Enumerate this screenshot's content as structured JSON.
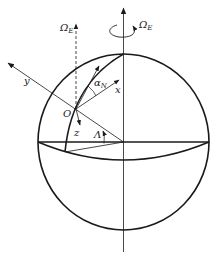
{
  "diagram": {
    "title": "",
    "labels": {
      "omega_e_axis": "Ω",
      "omega_e_axis_sub": "E",
      "omega_e_local": "Ω",
      "omega_e_local_sub": "E",
      "y_axis": "y",
      "x_axis": "x",
      "z_axis": "z",
      "origin": "O",
      "alpha": "α",
      "alpha_sub": "N",
      "latitude": "Λ"
    },
    "elements": [
      "Earth sphere (circle)",
      "Polar rotation axis with rotation arrow Ω_E",
      "Dashed local Ω_E direction through O",
      "Meridian arc through O",
      "Equator ellipse",
      "Local axes x, y, z at O",
      "Wander angle α_N between north and x",
      "Latitude angle Λ"
    ],
    "colors": {
      "stroke": "#1a1a1a",
      "background": "#ffffff"
    }
  }
}
